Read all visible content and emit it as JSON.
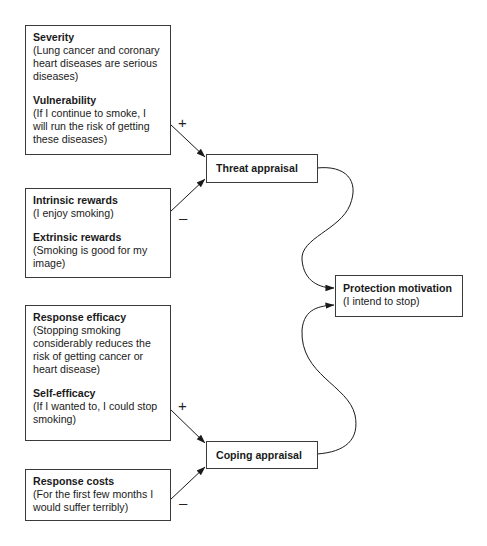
{
  "diagram": {
    "factors": [
      {
        "id": "threat-factors-positive",
        "items": [
          {
            "heading": "Severity",
            "text": "(Lung cancer and coronary heart diseases are serious diseases)"
          },
          {
            "heading": "Vulnerability",
            "text": "(If I continue to smoke, I will run the risk of getting these diseases)"
          }
        ]
      },
      {
        "id": "threat-factors-negative",
        "items": [
          {
            "heading": "Intrinsic rewards",
            "text": "(I enjoy smoking)"
          },
          {
            "heading": "Extrinsic rewards",
            "text": "(Smoking is good for my image)"
          }
        ]
      },
      {
        "id": "coping-factors-positive",
        "items": [
          {
            "heading": "Response efficacy",
            "text": "(Stopping smoking considerably reduces the risk of getting cancer or heart disease)"
          },
          {
            "heading": "Self-efficacy",
            "text": "(If I wanted to, I could stop smoking)"
          }
        ]
      },
      {
        "id": "coping-factors-negative",
        "items": [
          {
            "heading": "Response costs",
            "text": "(For the first few months I would suffer terribly)"
          }
        ]
      }
    ],
    "nodes": {
      "threat_appraisal": {
        "label": "Threat appraisal"
      },
      "coping_appraisal": {
        "label": "Coping appraisal"
      },
      "protection_motivation": {
        "label": "Protection motivation",
        "text": "(I intend to stop)"
      }
    },
    "signs": {
      "severity_vulnerability": "+",
      "rewards": "–",
      "efficacy": "+",
      "costs": "–"
    },
    "edges": [
      {
        "from": "threat-factors-positive",
        "to": "threat_appraisal",
        "sign": "+"
      },
      {
        "from": "threat-factors-negative",
        "to": "threat_appraisal",
        "sign": "–"
      },
      {
        "from": "coping-factors-positive",
        "to": "coping_appraisal",
        "sign": "+"
      },
      {
        "from": "coping-factors-negative",
        "to": "coping_appraisal",
        "sign": "–"
      },
      {
        "from": "threat_appraisal",
        "to": "protection_motivation"
      },
      {
        "from": "coping_appraisal",
        "to": "protection_motivation"
      }
    ]
  }
}
